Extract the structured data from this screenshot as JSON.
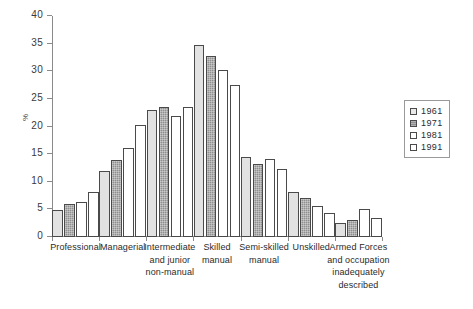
{
  "chart_data": {
    "type": "bar",
    "title": "",
    "subtitle": "",
    "xlabel": "",
    "ylabel": "%",
    "ylim": [
      0,
      40
    ],
    "yticks": [
      "0",
      "5",
      "10",
      "15",
      "20",
      "25",
      "30",
      "35",
      "40"
    ],
    "grid": false,
    "legend_position": "right",
    "categories": [
      "Professional",
      "Managerial",
      "Intermediate and junior non-manual",
      "Skilled manual",
      "Semi-skilled manual",
      "Unskilled",
      "Armed Forces and occupation inadequately described"
    ],
    "category_label_lines": [
      [
        "Professional"
      ],
      [
        "Managerial"
      ],
      [
        "Intermediate",
        "and junior",
        "non-manual"
      ],
      [
        "Skilled",
        "manual"
      ],
      [
        "Semi-skilled",
        "manual"
      ],
      [
        "Unskilled"
      ],
      [
        "Armed Forces",
        "and occupation",
        "inadequately",
        "described"
      ]
    ],
    "series": [
      {
        "name": "1961",
        "fill": "#e2e2e2",
        "values": [
          4.8,
          11.9,
          22.9,
          34.8,
          14.5,
          8.2,
          2.5
        ]
      },
      {
        "name": "1971",
        "fill": "#8f8f8f",
        "values": [
          6.0,
          13.9,
          23.5,
          32.8,
          13.3,
          7.1,
          3.0
        ]
      },
      {
        "name": "1981",
        "fill": "#ffffff",
        "values": [
          6.4,
          16.1,
          21.9,
          30.2,
          14.2,
          5.7,
          5.1
        ]
      },
      {
        "name": "1991",
        "fill": "#ffffff",
        "values": [
          8.2,
          20.2,
          23.6,
          27.6,
          12.3,
          4.3,
          3.4
        ]
      }
    ]
  },
  "legend": {
    "items": [
      "1961",
      "1971",
      "1981",
      "1991"
    ]
  },
  "axis": {
    "y_title": "%"
  }
}
